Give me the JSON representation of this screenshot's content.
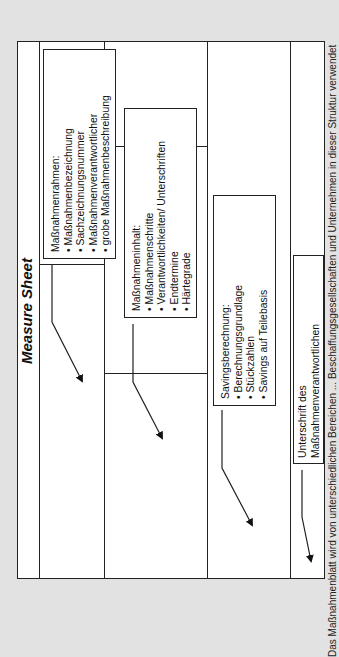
{
  "document": {
    "title": "Measure Sheet",
    "orientation": "rotated-90-counterclockwise"
  },
  "boxes": [
    {
      "id": "massnahmenrahmen",
      "heading": "Maßnahmenrahmen:",
      "items": [
        "Maßnahmenbezeichnung",
        "Sachzeichnungsnummer",
        "Maßnahmenverantwortlicher",
        "grobe Maßnahmenbeschreibung"
      ]
    },
    {
      "id": "massnahmeninhalt",
      "heading": "Maßnahmeninhalt:",
      "items": [
        "Maßnahmenschritte",
        "Verantwortlichkeiten/ Unterschriften",
        "Endtermine",
        "Härtegrade"
      ]
    },
    {
      "id": "savingsberechnung",
      "heading": "Savingsberechnung:",
      "items": [
        "Berechnungsgrundlage",
        "Stückzahlen",
        "Savings auf Teilebasis"
      ]
    },
    {
      "id": "unterschrift",
      "heading": "Unterschrift des",
      "items": [
        "Maßnahmenverantwortlichen"
      ]
    }
  ],
  "bullet": "•",
  "caption": "Das Maßnahmenblatt wird von unterschiedlichen Bereichen ... Beschaffungsgesellschaften und Unternehmen in dieser Struktur verwendet",
  "colors": {
    "background": "#e2e2e2",
    "paper": "#ffffff",
    "ink": "#222222"
  }
}
